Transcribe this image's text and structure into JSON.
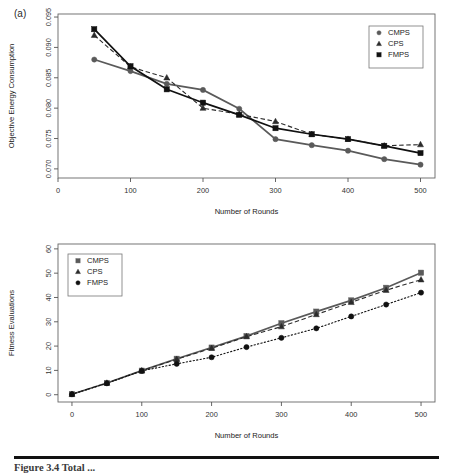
{
  "figure": {
    "panel_label": "(a)",
    "caption": "Figure 3.4   Total ...",
    "colors": {
      "cmps": "#5a5a5a",
      "cps": "#2b2b2b",
      "fmps": "#111111",
      "axis": "#555555",
      "background": "#ffffff"
    }
  },
  "chart_data": [
    {
      "id": "top",
      "type": "line",
      "title": "",
      "xlabel": "Number of Rounds",
      "ylabel": "Objective Energy Consumption",
      "xlim": [
        0,
        520
      ],
      "ylim": [
        0.0685,
        0.0955
      ],
      "xticks": [
        0,
        100,
        200,
        300,
        400,
        500
      ],
      "xticklabels": [
        "0",
        "100",
        "200",
        "300",
        "400",
        "500"
      ],
      "yticks": [
        0.07,
        0.075,
        0.08,
        0.085,
        0.09,
        0.095
      ],
      "yticklabels": [
        "0.070",
        "0.075",
        "0.080",
        "0.085",
        "0.090",
        "0.095"
      ],
      "grid": false,
      "legend_position": "top-right",
      "x": [
        50,
        100,
        150,
        200,
        250,
        300,
        350,
        400,
        450,
        500
      ],
      "series": [
        {
          "name": "CMPS",
          "marker": "circle",
          "linestyle": "solid-thin",
          "values": [
            0.088,
            0.0861,
            0.084,
            0.083,
            0.0799,
            0.0749,
            0.0739,
            0.073,
            0.0716,
            0.0707
          ]
        },
        {
          "name": "CPS",
          "marker": "triangle",
          "linestyle": "dashed",
          "values": [
            0.092,
            0.0868,
            0.085,
            0.08,
            0.079,
            0.0778,
            0.0757,
            0.0749,
            0.0738,
            0.074
          ]
        },
        {
          "name": "FMPS",
          "marker": "square",
          "linestyle": "solid",
          "values": [
            0.093,
            0.0869,
            0.0831,
            0.0809,
            0.0789,
            0.0767,
            0.0757,
            0.0749,
            0.0738,
            0.0726
          ]
        }
      ]
    },
    {
      "id": "bottom",
      "type": "line",
      "title": "",
      "xlabel": "Number of Rounds",
      "ylabel": "Fitness Evaluations",
      "xlim": [
        -20,
        520
      ],
      "ylim": [
        -3,
        62
      ],
      "xticks": [
        0,
        100,
        200,
        300,
        400,
        500
      ],
      "xticklabels": [
        "0",
        "100",
        "200",
        "300",
        "400",
        "500"
      ],
      "yticks": [
        0,
        10,
        20,
        30,
        40,
        50,
        60
      ],
      "yticklabels": [
        "0",
        "10",
        "20",
        "30",
        "40",
        "50",
        "60"
      ],
      "grid": false,
      "legend_position": "top-left",
      "x": [
        0,
        50,
        100,
        150,
        200,
        250,
        300,
        350,
        400,
        450,
        500
      ],
      "series": [
        {
          "name": "CMPS",
          "marker": "square",
          "linestyle": "solid",
          "values": [
            0.2,
            4.8,
            9.9,
            14.8,
            19.4,
            24.1,
            29.4,
            34.2,
            38.8,
            44.0,
            50.2
          ]
        },
        {
          "name": "CPS",
          "marker": "triangle",
          "linestyle": "dashed",
          "values": [
            0.2,
            4.8,
            9.9,
            14.6,
            19.1,
            23.9,
            28.0,
            33.0,
            38.0,
            43.0,
            47.3
          ]
        },
        {
          "name": "FMPS",
          "marker": "circle",
          "linestyle": "dotted",
          "values": [
            0.2,
            4.7,
            9.8,
            12.7,
            15.4,
            19.6,
            23.4,
            27.3,
            32.2,
            37.1,
            42.0
          ]
        }
      ]
    }
  ]
}
